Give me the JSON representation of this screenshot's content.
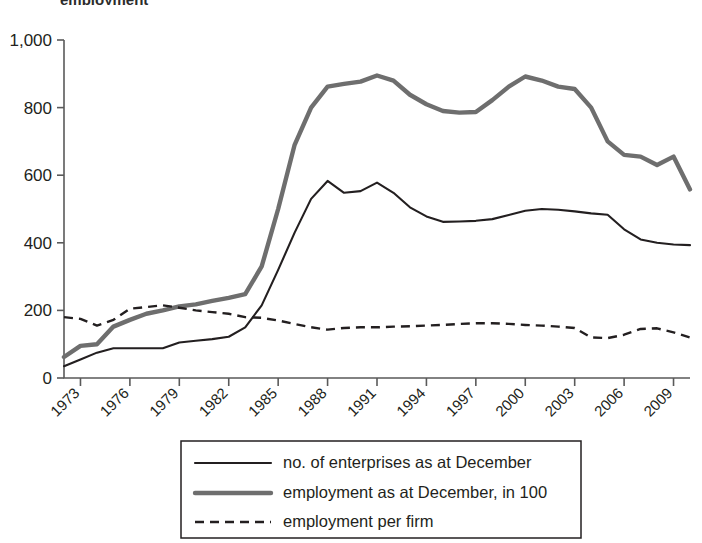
{
  "figure": {
    "title_remnant": "employment",
    "background": "#ffffff"
  },
  "colors": {
    "enterprises": "#231f20",
    "employment": "#6e6e6e",
    "per_firm": "#231f20",
    "axis": "#5a5a5a",
    "text": "#231f20"
  },
  "legend": {
    "position": "bottom-center",
    "items": [
      {
        "label": "no. of enterprises as at December",
        "style": "solid-thin",
        "color": "#231f20"
      },
      {
        "label": "employment as at December, in 100",
        "style": "solid-thick",
        "color": "#6e6e6e"
      },
      {
        "label": "employment per firm",
        "style": "dashed",
        "color": "#231f20"
      }
    ]
  },
  "axes": {
    "y_ticks": [
      "0",
      "200",
      "400",
      "600",
      "800",
      "1,000"
    ],
    "x_ticks": [
      "1973",
      "1976",
      "1979",
      "1982",
      "1985",
      "1988",
      "1991",
      "1994",
      "1997",
      "2000",
      "2003",
      "2006",
      "2009"
    ],
    "x_tick_rotation_deg": -45
  },
  "chart_data": {
    "type": "line",
    "title": "",
    "xlabel": "",
    "ylabel": "",
    "xlim": [
      1972,
      2010
    ],
    "ylim": [
      0,
      1000
    ],
    "grid": false,
    "legend_position": "bottom-center",
    "x": [
      1972,
      1973,
      1974,
      1975,
      1976,
      1977,
      1978,
      1979,
      1980,
      1981,
      1982,
      1983,
      1984,
      1985,
      1986,
      1987,
      1988,
      1989,
      1990,
      1991,
      1992,
      1993,
      1994,
      1995,
      1996,
      1997,
      1998,
      1999,
      2000,
      2001,
      2002,
      2003,
      2004,
      2005,
      2006,
      2007,
      2008,
      2009,
      2010
    ],
    "series": [
      {
        "name": "no. of enterprises as at December",
        "style": "solid-thin",
        "color": "#231f20",
        "values": [
          35,
          55,
          75,
          88,
          88,
          88,
          88,
          105,
          110,
          115,
          122,
          150,
          215,
          320,
          430,
          530,
          583,
          548,
          553,
          578,
          548,
          505,
          478,
          462,
          463,
          465,
          470,
          482,
          495,
          500,
          498,
          493,
          487,
          483,
          440,
          410,
          400,
          395,
          393
        ]
      },
      {
        "name": "employment as at December, in 100",
        "style": "solid-thick",
        "color": "#6e6e6e",
        "values": [
          62,
          95,
          100,
          152,
          172,
          190,
          200,
          212,
          218,
          228,
          237,
          248,
          330,
          500,
          690,
          800,
          862,
          870,
          877,
          895,
          880,
          838,
          810,
          790,
          785,
          787,
          822,
          862,
          892,
          880,
          862,
          855,
          800,
          700,
          660,
          655,
          630,
          655,
          558
        ]
      },
      {
        "name": "employment per firm",
        "style": "dashed",
        "color": "#231f20",
        "values": [
          180,
          175,
          155,
          172,
          205,
          210,
          215,
          208,
          200,
          195,
          190,
          180,
          178,
          170,
          160,
          150,
          143,
          148,
          150,
          150,
          152,
          153,
          155,
          157,
          160,
          162,
          162,
          160,
          157,
          155,
          152,
          148,
          120,
          118,
          128,
          145,
          147,
          135,
          120
        ]
      }
    ]
  }
}
